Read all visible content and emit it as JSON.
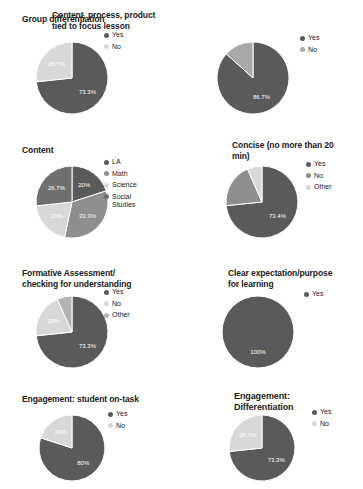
{
  "palette": {
    "dark": "#5a5a5a",
    "medium": "#8e8e8e",
    "light": "#d8d8d8",
    "mid_dark": "#6f6f6f",
    "label_text": "#ffffff",
    "title_text": "#1a1a1a",
    "background": "#ffffff"
  },
  "charts": [
    {
      "id": "group-differentiation",
      "title": "Group differentiation",
      "chart_data": {
        "type": "pie",
        "title": "Group differentiation",
        "categories": [
          "Yes",
          "No"
        ],
        "values": [
          73.3,
          26.7
        ],
        "labels": [
          "73.3%",
          "26.7%"
        ],
        "colors": [
          "#5a5a5a",
          "#d8d8d8"
        ],
        "legend": [
          "Yes",
          "No"
        ],
        "legend_position": "right",
        "start_angle": 0,
        "direction": "clockwise"
      }
    },
    {
      "id": "content-process-product",
      "title": "Content, process, product\ntied to focus lesson",
      "chart_data": {
        "type": "pie",
        "title": "Content, process, product tied to focus lesson",
        "categories": [
          "Yes",
          "No"
        ],
        "values": [
          86.7,
          13.3
        ],
        "labels": [
          "86.7%",
          ""
        ],
        "colors": [
          "#5a5a5a",
          "#a8a8a8"
        ],
        "legend": [
          "Yes",
          "No"
        ],
        "legend_position": "right",
        "start_angle": 0,
        "direction": "clockwise"
      }
    },
    {
      "id": "content",
      "title": "Content",
      "chart_data": {
        "type": "pie",
        "title": "Content",
        "categories": [
          "LA",
          "Math",
          "Science",
          "Social Studies"
        ],
        "values": [
          20.0,
          33.3,
          20.0,
          26.7
        ],
        "labels": [
          "20%",
          "33.3%",
          "20%",
          "26.7%"
        ],
        "colors": [
          "#5a5a5a",
          "#8e8e8e",
          "#d8d8d8",
          "#6f6f6f"
        ],
        "legend": [
          "LA",
          "Math",
          "Science",
          "Social\nStudies"
        ],
        "legend_position": "right",
        "start_angle": 0,
        "direction": "clockwise"
      }
    },
    {
      "id": "concise",
      "title": "Concise (no more than 20\nmin)",
      "chart_data": {
        "type": "pie",
        "title": "Concise (no more than 20 min)",
        "categories": [
          "Yes",
          "No",
          "Other"
        ],
        "values": [
          73.4,
          20.0,
          6.6
        ],
        "labels": [
          "73.4%",
          "",
          ""
        ],
        "colors": [
          "#5a5a5a",
          "#8e8e8e",
          "#d8d8d8"
        ],
        "legend": [
          "Yes",
          "No",
          "Other"
        ],
        "legend_position": "right",
        "start_angle": 0,
        "direction": "clockwise"
      }
    },
    {
      "id": "formative-assessment",
      "title": "Formative Assessment/\nchecking for understanding",
      "chart_data": {
        "type": "pie",
        "title": "Formative Assessment/ checking for understanding",
        "categories": [
          "Yes",
          "No",
          "Other"
        ],
        "values": [
          73.3,
          20.0,
          6.7
        ],
        "labels": [
          "73.3%",
          "20%",
          ""
        ],
        "colors": [
          "#5a5a5a",
          "#d8d8d8",
          "#b4b4b4"
        ],
        "legend": [
          "Yes",
          "No",
          "Other"
        ],
        "legend_position": "right",
        "start_angle": 0,
        "direction": "clockwise"
      }
    },
    {
      "id": "clear-expectation",
      "title": "Clear expectation/purpose\nfor learning",
      "chart_data": {
        "type": "pie",
        "title": "Clear expectation/purpose for learning",
        "categories": [
          "Yes"
        ],
        "values": [
          100.0
        ],
        "labels": [
          "100%"
        ],
        "colors": [
          "#5a5a5a"
        ],
        "legend": [
          "Yes"
        ],
        "legend_position": "right",
        "start_angle": 0,
        "direction": "clockwise"
      }
    },
    {
      "id": "engagement-on-task",
      "title": "Engagement: student on-task",
      "chart_data": {
        "type": "pie",
        "title": "Engagement: student on-task",
        "categories": [
          "Yes",
          "No"
        ],
        "values": [
          80.0,
          20.0
        ],
        "labels": [
          "80%",
          "20%"
        ],
        "colors": [
          "#5a5a5a",
          "#d8d8d8"
        ],
        "legend": [
          "Yes",
          "No"
        ],
        "legend_position": "right",
        "start_angle": 0,
        "direction": "clockwise"
      }
    },
    {
      "id": "engagement-differentiation",
      "title": "Engagement:\nDifferentiation",
      "chart_data": {
        "type": "pie",
        "title": "Engagement: Differentiation",
        "categories": [
          "Yes",
          "No"
        ],
        "values": [
          73.3,
          26.7
        ],
        "labels": [
          "73.3%",
          "26.7%"
        ],
        "colors": [
          "#5a5a5a",
          "#d8d8d8"
        ],
        "legend": [
          "Yes",
          "No"
        ],
        "legend_position": "right",
        "start_angle": 0,
        "direction": "clockwise"
      }
    }
  ]
}
